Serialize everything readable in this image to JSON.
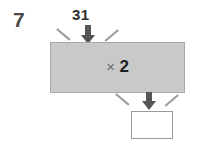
{
  "question": {
    "number": "7"
  },
  "machine": {
    "input_label": "31",
    "operation_sign": "×",
    "operation_value": "2",
    "answer_value": ""
  },
  "icons": {
    "input_arrow": "arrow-down-icon",
    "output_arrow": "arrow-down-icon"
  },
  "colors": {
    "box_fill": "#c9c9c9",
    "box_border": "#a8a8a8",
    "arrow": "#555555",
    "splay_line": "#9a9a9a",
    "text": "#1f1f1f",
    "question_number": "#4a4a4a",
    "answer_box_border": "#9a9a9a",
    "page_background": "#ffffff"
  }
}
